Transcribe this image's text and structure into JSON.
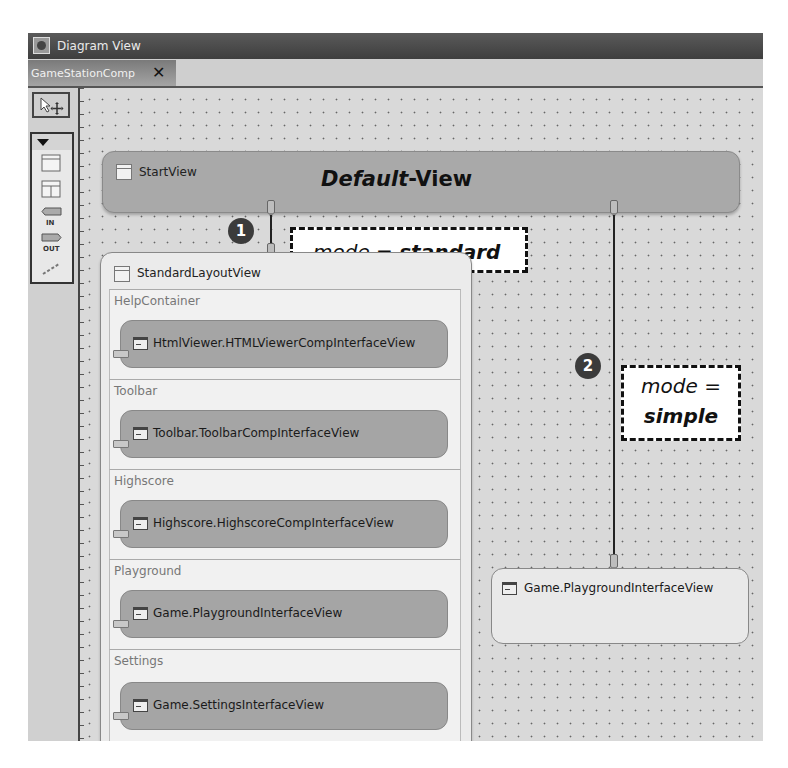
{
  "window": {
    "title": "Diagram View",
    "app_icon": "diagram-view-icon"
  },
  "tabs": [
    {
      "label": "GameStationComp",
      "close_icon": "close-icon",
      "active": true
    }
  ],
  "palette": {
    "select_tool": "select-move-icon",
    "collapse_icon": "triangle-down-icon",
    "tools": [
      {
        "name": "view-icon"
      },
      {
        "name": "view-container-icon"
      },
      {
        "name": "inbound-plug-icon",
        "label": "IN"
      },
      {
        "name": "outbound-plug-icon",
        "label": "OUT"
      },
      {
        "name": "navigation-link-icon"
      }
    ]
  },
  "diagram": {
    "start_view": {
      "name": "StartView",
      "annotation": {
        "italic": "Default",
        "rest": "-View"
      }
    },
    "link1": {
      "badge": "1",
      "callout": {
        "prefix": "mode = ",
        "value": "standard"
      }
    },
    "link2": {
      "badge": "2",
      "callout": {
        "prefix": "mode =",
        "value": "simple"
      }
    },
    "standard_layout_view": {
      "name": "StandardLayoutView",
      "containers": [
        {
          "name": "HelpContainer",
          "view": "HtmlViewer.HTMLViewerCompInterfaceView"
        },
        {
          "name": "Toolbar",
          "view": "Toolbar.ToolbarCompInterfaceView"
        },
        {
          "name": "Highscore",
          "view": "Highscore.HighscoreCompInterfaceView"
        },
        {
          "name": "Playground",
          "view": "Game.PlaygroundInterfaceView"
        },
        {
          "name": "Settings",
          "view": "Game.SettingsInterfaceView"
        }
      ]
    },
    "simple_view": {
      "view": "Game.PlaygroundInterfaceView"
    }
  }
}
